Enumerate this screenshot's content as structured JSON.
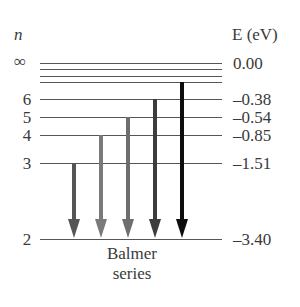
{
  "diagram": {
    "type": "energy-level-diagram",
    "left_header": "n",
    "right_header": "E (eV)",
    "caption_line1": "Balmer",
    "caption_line2": "series",
    "levels": [
      {
        "n": "∞",
        "energy": "0.00",
        "y": 63,
        "show_n": true,
        "show_e": true
      },
      {
        "n": "",
        "energy": "",
        "y": 69,
        "show_n": false,
        "show_e": false
      },
      {
        "n": "",
        "energy": "",
        "y": 76,
        "show_n": false,
        "show_e": false
      },
      {
        "n": "",
        "energy": "",
        "y": 82,
        "show_n": false,
        "show_e": false
      },
      {
        "n": "6",
        "energy": "–0.38",
        "y": 99,
        "show_n": true,
        "show_e": true
      },
      {
        "n": "5",
        "energy": "–0.54",
        "y": 117,
        "show_n": true,
        "show_e": true
      },
      {
        "n": "4",
        "energy": "–0.85",
        "y": 135,
        "show_n": true,
        "show_e": true
      },
      {
        "n": "3",
        "energy": "–1.51",
        "y": 163,
        "show_n": true,
        "show_e": true
      },
      {
        "n": "2",
        "energy": "–3.40",
        "y": 239,
        "show_n": true,
        "show_e": true
      }
    ],
    "transitions": [
      {
        "from": "3",
        "to": "2",
        "x": 74,
        "y_start": 163,
        "color": "#555555",
        "width": 4
      },
      {
        "from": "4",
        "to": "2",
        "x": 101,
        "y_start": 135,
        "color": "#7a7a7a",
        "width": 4
      },
      {
        "from": "5",
        "to": "2",
        "x": 128,
        "y_start": 117,
        "color": "#6e6e6e",
        "width": 4
      },
      {
        "from": "6",
        "to": "2",
        "x": 155,
        "y_start": 99,
        "color": "#3c3c3c",
        "width": 4
      },
      {
        "from": "7",
        "to": "2",
        "x": 182,
        "y_start": 82,
        "color": "#0d0d0d",
        "width": 4
      }
    ],
    "line_color": "#555555",
    "line_x_start": 40,
    "line_x_end": 222,
    "arrow_tip_y": 238
  },
  "labels": {
    "n_inf": "∞",
    "n6": "6",
    "n5": "5",
    "n4": "4",
    "n3": "3",
    "n2": "2",
    "e_inf": "0.00",
    "e6": "–0.38",
    "e5": "–0.54",
    "e4": "–0.85",
    "e3": "–1.51",
    "e2": "–3.40"
  }
}
